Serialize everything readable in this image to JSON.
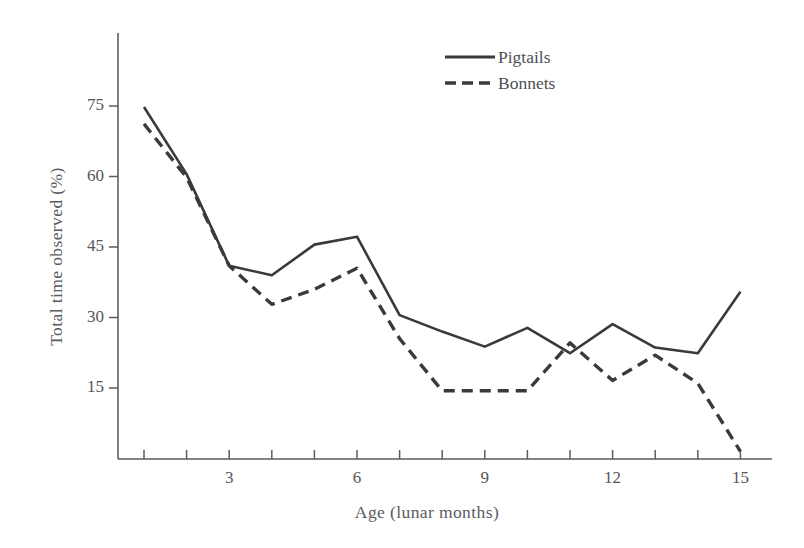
{
  "chart_data": {
    "type": "line",
    "title": "",
    "xlabel": "Age (lunar months)",
    "ylabel": "Total time observed (%)",
    "xlim": [
      0,
      16
    ],
    "ylim": [
      0,
      82
    ],
    "grid": false,
    "legend_position": "top-center-right",
    "xticks": [
      1,
      2,
      3,
      4,
      5,
      6,
      7,
      8,
      9,
      10,
      11,
      12,
      13,
      14,
      15
    ],
    "xtick_labels": [
      "",
      "",
      "3",
      "",
      "",
      "6",
      "",
      "",
      "9",
      "",
      "",
      "12",
      "",
      "",
      "15"
    ],
    "yticks": [
      15,
      30,
      45,
      60,
      75
    ],
    "ytick_labels": [
      "15",
      "30",
      "45",
      "60",
      "75"
    ],
    "x": [
      1,
      2,
      3,
      4,
      5,
      6,
      7,
      8,
      9,
      10,
      11,
      12,
      13,
      14,
      15
    ],
    "series": [
      {
        "name": "Pigtails",
        "style": "solid",
        "color": "#3a3a3c",
        "values": [
          74.8,
          60.5,
          41.0,
          39.0,
          45.5,
          47.2,
          30.5,
          27.0,
          23.8,
          27.8,
          22.4,
          28.6,
          23.6,
          22.4,
          35.5
        ]
      },
      {
        "name": "Bonnets",
        "style": "dashed",
        "color": "#3a3a3c",
        "values": [
          71.2,
          59.8,
          41.0,
          32.8,
          36.0,
          40.5,
          25.5,
          14.4,
          14.4,
          14.4,
          24.6,
          16.6,
          22.0,
          16.0,
          1.5
        ]
      }
    ]
  },
  "legend": {
    "items": [
      {
        "label": "Pigtails",
        "style": "solid"
      },
      {
        "label": "Bonnets",
        "style": "dashed"
      }
    ]
  },
  "axes": {
    "y_axis_name": "y-axis",
    "x_axis_name": "x-axis"
  }
}
